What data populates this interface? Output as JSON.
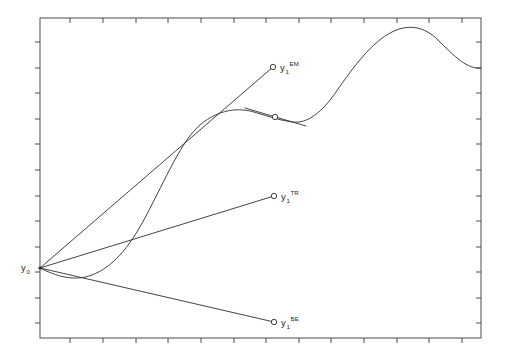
{
  "figure": {
    "title": "",
    "background_color": "#ffffff",
    "line_color": "#2e2e2e",
    "axis_color": "#3a3a3a",
    "width": 508,
    "height": 361
  },
  "labels": {
    "y0": {
      "base": "y",
      "sub": "0",
      "sup": ""
    },
    "euler": {
      "base": "y",
      "sub": "1",
      "sup": "EM"
    },
    "trapezoidal": {
      "base": "y",
      "sub": "1",
      "sup": "TR"
    },
    "backward_euler": {
      "base": "y",
      "sub": "1",
      "sup": "BE"
    }
  },
  "chart_data": {
    "type": "line",
    "title": "",
    "xlabel": "",
    "ylabel": "",
    "xlim": [
      0,
      508
    ],
    "ylim": [
      361,
      0
    ],
    "grid": false,
    "legend": "none",
    "axis_box": {
      "left": 40,
      "top": 18,
      "right": 481,
      "bottom": 338
    },
    "x_ticks_top": [
      70,
      103,
      136,
      168,
      201,
      234,
      266,
      299,
      331,
      364,
      397,
      429,
      462
    ],
    "x_ticks_bottom": [
      70,
      103,
      136,
      168,
      201,
      234,
      266,
      299,
      331,
      364,
      397,
      429,
      462
    ],
    "y_ticks_left": [
      42,
      68,
      93,
      119,
      144,
      170,
      196,
      221,
      247,
      272,
      298,
      323
    ],
    "y_ticks_right": [
      42,
      68,
      93,
      119,
      144,
      170,
      196,
      221,
      247,
      272,
      298,
      323
    ],
    "tick_length": 5,
    "start_point": {
      "name": "y0",
      "x": 40,
      "y": 268
    },
    "series": [
      {
        "name": "exact solution",
        "kind": "curve",
        "path": "M 40 268 C 56 276, 74 282, 92 275 C 112 267, 128 250, 146 216 C 166 178, 182 140, 200 125 C 220 108, 240 108, 254 112 C 268 116, 278 120, 292 122 C 308 124, 322 112, 336 92 C 354 66, 372 42, 392 32 C 408 24, 424 26, 438 40 C 454 56, 468 70, 481 68"
      },
      {
        "name": "euler method step",
        "kind": "segment",
        "x1": 40,
        "y1": 268,
        "x2": 273,
        "y2": 67
      },
      {
        "name": "trapezoidal rule step",
        "kind": "segment",
        "x1": 40,
        "y1": 268,
        "x2": 274,
        "y2": 196
      },
      {
        "name": "backward euler step",
        "kind": "segment",
        "x1": 40,
        "y1": 268,
        "x2": 274,
        "y2": 322
      },
      {
        "name": "tangent at curve point",
        "kind": "segment",
        "x1": 245,
        "y1": 108,
        "x2": 306,
        "y2": 126
      }
    ],
    "markers": [
      {
        "name": "euler endpoint",
        "x": 273,
        "y": 67,
        "r": 2.7
      },
      {
        "name": "curve sample point",
        "x": 275,
        "y": 117,
        "r": 2.7
      },
      {
        "name": "trapezoidal endpoint",
        "x": 274,
        "y": 196,
        "r": 2.7
      },
      {
        "name": "backward euler endpoint",
        "x": 274,
        "y": 322,
        "r": 2.7
      },
      {
        "name": "initial point",
        "x": 40,
        "y": 268,
        "r": 1.6,
        "filled": true
      }
    ],
    "label_positions": {
      "y0": {
        "x": 21,
        "y": 271
      },
      "euler": {
        "x": 280,
        "y": 71
      },
      "trapezoidal": {
        "x": 281,
        "y": 200
      },
      "backward_euler": {
        "x": 281,
        "y": 326
      }
    }
  }
}
